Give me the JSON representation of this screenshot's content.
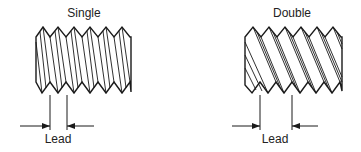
{
  "panels": [
    {
      "id": "single",
      "title": "Single",
      "dimension_label": "Lead",
      "thread_starts": 1
    },
    {
      "id": "double",
      "title": "Double",
      "dimension_label": "Lead",
      "thread_starts": 2
    }
  ],
  "colors": {
    "line": "#1a1a1a",
    "text": "#222222",
    "background": "#ffffff"
  }
}
